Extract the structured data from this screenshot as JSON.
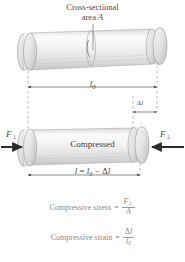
{
  "figure": {
    "title_label_line1": "Cross-sectional",
    "title_label_line2_prefix": "area ",
    "title_label_line2_symbol": "A",
    "original_length_symbol": "l",
    "original_length_subscript": "0",
    "delta_symbol": "Δ",
    "delta_length_symbol": "l",
    "compressed_label": "Compressed",
    "length_equation": {
      "l": "l",
      "equals": "=",
      "l0": "l",
      "l0_sub": "0",
      "minus": "−",
      "delta": "Δ",
      "delta_l": "l"
    },
    "force_left_symbol": "F",
    "force_left_subscript": "⊥",
    "force_right_symbol": "F",
    "force_right_subscript": "⊥",
    "colors": {
      "cylinder_body": "#e9e9ea",
      "cylinder_highlight": "#fdfdfd",
      "cylinder_shadow": "#bdbdbe",
      "outline": "#8d8d8f",
      "arrow": "#2f2f2f",
      "dimension_line": "#5a5a5a",
      "dashed_guide": "#8a8a8a",
      "formula_text": "#8a8a8a",
      "label_text": "#4a4a4a"
    }
  },
  "formulas": {
    "stress": {
      "label": "Compressive stress",
      "equals": "=",
      "numerator": "F",
      "numerator_sub": "⊥",
      "denominator": "A"
    },
    "strain": {
      "label": "Compressive strain",
      "equals": "=",
      "numerator_delta": "Δ",
      "numerator": "l",
      "denominator": "l",
      "denominator_sub": "0"
    }
  }
}
